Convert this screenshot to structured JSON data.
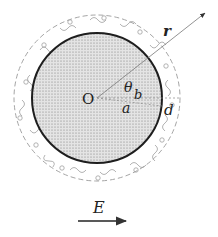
{
  "diagram": {
    "center_label": "O",
    "radius_label": "r",
    "angle_label": "θ",
    "inner_radius_label": "a",
    "outer_radius_label": "b",
    "layer_thickness_label": "d",
    "field_label": "E",
    "colors": {
      "particle_fill": "#d6d6d6",
      "particle_stroke": "#222222",
      "layer_stroke": "#9a9a9a",
      "arrow": "#333333"
    }
  }
}
